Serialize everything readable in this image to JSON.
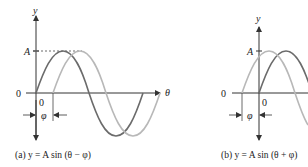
{
  "figure": {
    "panel_a": {
      "caption": "(a) y = A sin (θ − φ)",
      "y_axis_label": "y",
      "x_axis_label": "θ",
      "amplitude_label": "A",
      "origin_label_left": "0",
      "origin_label_below": "0",
      "phase_label": "φ",
      "curves": [
        {
          "name": "sin θ",
          "shade": "dark",
          "color": "#6b6b6b"
        },
        {
          "name": "A sin (θ − φ)",
          "shade": "light",
          "color": "#b8b8b8",
          "shift": "right by φ"
        }
      ]
    },
    "panel_b": {
      "caption": "(b) y = A sin (θ + φ)",
      "y_axis_label": "y",
      "amplitude_label": "A",
      "origin_label_left": "0",
      "origin_label_below": "0",
      "phase_label": "φ",
      "curves": [
        {
          "name": "sin θ",
          "shade": "dark",
          "color": "#6b6b6b"
        },
        {
          "name": "A sin (θ + φ)",
          "shade": "light",
          "color": "#b8b8b8",
          "shift": "left by φ"
        }
      ]
    }
  }
}
